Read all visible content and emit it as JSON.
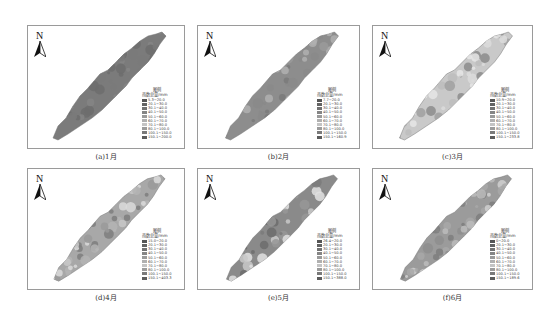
{
  "legend_common": {
    "title": "图例",
    "header": "雨量",
    "unit": "mm",
    "swatches": [
      "#555555",
      "#636363",
      "#727272",
      "#858585",
      "#9a9a9a",
      "#b0b0b0",
      "#c4c4c4",
      "#9c9c9c",
      "#7a7a7a",
      "#5c5c5c",
      "#404040"
    ]
  },
  "panels": [
    {
      "caption": "(a)1月",
      "north": "N",
      "legend_title": "图例",
      "legend_header": "雨数总量/mm",
      "classes": [
        "5.3~20.0",
        "20.1~30.0",
        "30.1~40.0",
        "40.1~50.0",
        "50.1~60.0",
        "60.1~70.0",
        "70.1~80.0",
        "80.1~100.0",
        "100.1~150.0",
        "150.1~200.0"
      ],
      "fill": "#7b7b7b"
    },
    {
      "caption": "(b)2月",
      "north": "N",
      "legend_title": "图例",
      "legend_header": "雨数总量/mm",
      "classes": [
        "7.7~20.0",
        "20.1~30.0",
        "30.1~40.0",
        "40.1~50.0",
        "50.1~60.0",
        "60.1~70.0",
        "70.1~80.0",
        "80.1~100.0",
        "100.1~150.0",
        "150.1~160.9"
      ],
      "fill": "#8d8d8d"
    },
    {
      "caption": "(c)3月",
      "north": "N",
      "legend_title": "图例",
      "legend_header": "雨数总量/mm",
      "classes": [
        "10.9~20.0",
        "20.1~30.0",
        "30.1~40.0",
        "40.1~50.0",
        "50.1~60.0",
        "60.1~70.0",
        "70.1~80.0",
        "80.1~100.0",
        "100.1~150.0",
        "150.1~233.8"
      ],
      "fill": "#c9c9c9"
    },
    {
      "caption": "(d)4月",
      "north": "N",
      "legend_title": "图例",
      "legend_header": "雨数总量/mm",
      "classes": [
        "15.0~20.0",
        "20.1~30.0",
        "30.1~40.0",
        "40.1~50.0",
        "50.1~60.0",
        "60.1~70.0",
        "70.1~80.0",
        "80.1~100.0",
        "100.1~150.0",
        "150.1~403.3"
      ],
      "fill": "#a8a8a8"
    },
    {
      "caption": "(e)5月",
      "north": "N",
      "legend_title": "图例",
      "legend_header": "雨数总量/mm",
      "classes": [
        "26.4~20.0",
        "20.1~30.0",
        "30.1~40.0",
        "40.1~50.0",
        "50.1~60.0",
        "60.1~70.0",
        "70.1~80.0",
        "80.1~100.0",
        "100.1~150.0",
        "150.1~388.0"
      ],
      "fill": "#8a8a8a"
    },
    {
      "caption": "(f)6月",
      "north": "N",
      "legend_title": "图例",
      "legend_header": "雨数总量/mm",
      "classes": [
        "0~20.0",
        "20.1~30.0",
        "30.1~40.0",
        "40.1~50.0",
        "50.1~60.0",
        "60.1~70.0",
        "70.1~80.0",
        "80.1~100.0",
        "100.1~150.0",
        "150.1~189.6"
      ],
      "fill": "#9b9b9b"
    }
  ]
}
